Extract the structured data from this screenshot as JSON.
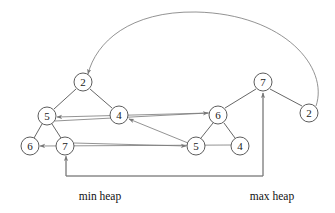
{
  "figure": {
    "width": 335,
    "height": 213,
    "background": "#ffffff",
    "node_stroke": "#4a4a4a",
    "tree_edge_color": "#555555",
    "pointer_edge_color": "#777777",
    "text_color": "#1a1a1a"
  },
  "captions": [
    {
      "id": "caption-min-heap",
      "text": "min heap",
      "x": 100,
      "y": 197
    },
    {
      "id": "caption-max-heap",
      "text": "max heap",
      "x": 272,
      "y": 197
    }
  ],
  "nodes": [
    {
      "id": "min-root",
      "label": "2",
      "x": 83,
      "y": 82,
      "r": 9,
      "heap": "min"
    },
    {
      "id": "min-l",
      "label": "5",
      "x": 47,
      "y": 116,
      "r": 9,
      "heap": "min"
    },
    {
      "id": "min-r",
      "label": "4",
      "x": 119,
      "y": 115,
      "r": 9,
      "heap": "min"
    },
    {
      "id": "min-ll",
      "label": "6",
      "x": 30,
      "y": 146,
      "r": 9,
      "heap": "min"
    },
    {
      "id": "min-lr",
      "label": "7",
      "x": 65,
      "y": 146,
      "r": 9,
      "heap": "min"
    },
    {
      "id": "max-root",
      "label": "7",
      "x": 263,
      "y": 82,
      "r": 9,
      "heap": "max"
    },
    {
      "id": "max-l",
      "label": "6",
      "x": 218,
      "y": 115,
      "r": 9,
      "heap": "max"
    },
    {
      "id": "max-r",
      "label": "2",
      "x": 309,
      "y": 113,
      "r": 9,
      "heap": "max"
    },
    {
      "id": "max-ll",
      "label": "5",
      "x": 196,
      "y": 146,
      "r": 9,
      "heap": "max"
    },
    {
      "id": "max-lr",
      "label": "4",
      "x": 240,
      "y": 146,
      "r": 9,
      "heap": "max"
    }
  ],
  "tree_edges": [
    {
      "id": "edge-min-root-l",
      "from": "min-root",
      "to": "min-l"
    },
    {
      "id": "edge-min-root-r",
      "from": "min-root",
      "to": "min-r"
    },
    {
      "id": "edge-min-l-ll",
      "from": "min-l",
      "to": "min-ll"
    },
    {
      "id": "edge-min-l-lr",
      "from": "min-l",
      "to": "min-lr"
    },
    {
      "id": "edge-max-root-l",
      "from": "max-root",
      "to": "max-l"
    },
    {
      "id": "edge-max-root-r",
      "from": "max-root",
      "to": "max-r"
    },
    {
      "id": "edge-max-l-ll",
      "from": "max-l",
      "to": "max-ll"
    },
    {
      "id": "edge-max-l-lr",
      "from": "max-l",
      "to": "max-lr"
    }
  ],
  "pointer_edges": [
    {
      "id": "ptr-max2-to-min2",
      "from": "max-r",
      "to": "min-root",
      "shape": "arc",
      "note": "long arc over the top"
    },
    {
      "id": "ptr-max6-to-min5",
      "from": "max-l",
      "to": "min-l",
      "shape": "line"
    },
    {
      "id": "ptr-max5-to-min4",
      "from": "max-ll",
      "to": "min-r",
      "shape": "line"
    },
    {
      "id": "ptr-min5-to-max6",
      "from": "min-l",
      "to": "max-l",
      "shape": "line"
    },
    {
      "id": "ptr-min7-to-max5",
      "from": "min-lr",
      "to": "max-ll",
      "shape": "line"
    },
    {
      "id": "ptr-max4-to-min6",
      "from": "max-lr",
      "to": "min-ll",
      "shape": "line"
    },
    {
      "id": "ptr-min7-max7-up",
      "from": "min-lr",
      "to": "max-root",
      "shape": "u-connector",
      "note": "bottom U connector, arrowheads at both ends pointing up"
    }
  ]
}
